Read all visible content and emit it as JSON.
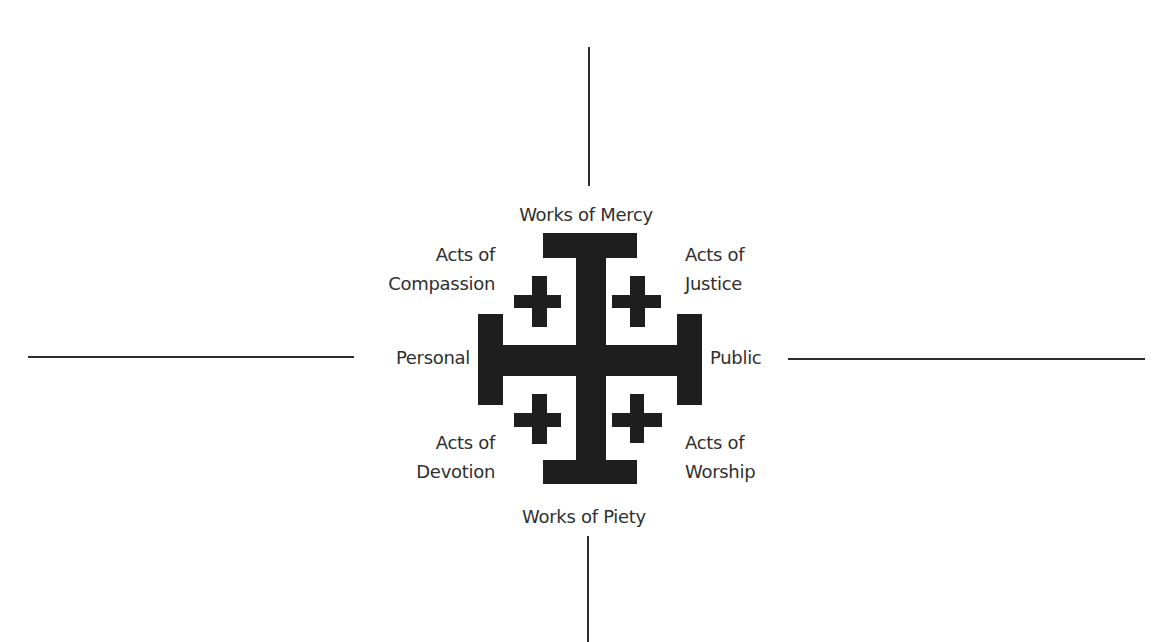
{
  "diagram": {
    "type": "jerusalem-cross-quadrant",
    "axes": {
      "vertical_top": "Works of Mercy",
      "vertical_bottom": "Works of Piety",
      "horizontal_left": "Personal",
      "horizontal_right": "Public"
    },
    "quadrants": {
      "top_left": {
        "line1": "Acts of",
        "line2": "Compassion"
      },
      "top_right": {
        "line1": "Acts of",
        "line2": "Justice"
      },
      "bottom_left": {
        "line1": "Acts of",
        "line2": "Devotion"
      },
      "bottom_right": {
        "line1": "Acts of",
        "line2": "Worship"
      }
    },
    "colors": {
      "ink": "#1e1e1e",
      "text": "#2f2f2f",
      "background": "#ffffff"
    }
  }
}
